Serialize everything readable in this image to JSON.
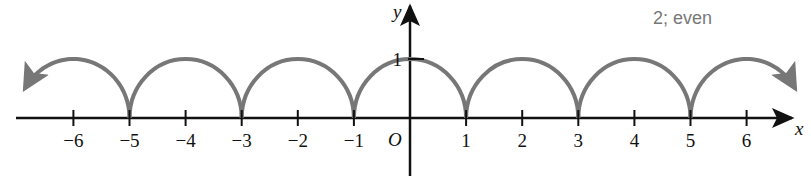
{
  "chart_data": {
    "type": "line",
    "title": "",
    "annotation": "2; even",
    "xlabel": "x",
    "ylabel": "y",
    "origin_label": "O",
    "x_ticks": [
      -6,
      -5,
      -4,
      -3,
      -2,
      -1,
      1,
      2,
      3,
      4,
      5,
      6
    ],
    "x_tick_labels": [
      "−6",
      "−5",
      "−4",
      "−3",
      "−2",
      "−1",
      "1",
      "2",
      "3",
      "4",
      "5",
      "6"
    ],
    "y_ticks": [
      1
    ],
    "y_tick_labels": [
      "1"
    ],
    "xlim": [
      -7,
      7
    ],
    "ylim": [
      -1,
      2
    ],
    "grid": false,
    "series": [
      {
        "name": "semicircle arches y = sqrt(1 - (x - 2k)^2)",
        "description": "Periodic curve of unit semicircular arches centered at even integers, period 2, even function, continuing in both directions (arrows)",
        "period": 2,
        "symmetry": "even",
        "x": [
          -6,
          -5,
          -4,
          -3,
          -2,
          -1,
          0,
          1,
          2,
          3,
          4,
          5,
          6
        ],
        "values": [
          1,
          0,
          1,
          0,
          1,
          0,
          1,
          0,
          1,
          0,
          1,
          0,
          1
        ],
        "color": "#777777"
      }
    ]
  }
}
